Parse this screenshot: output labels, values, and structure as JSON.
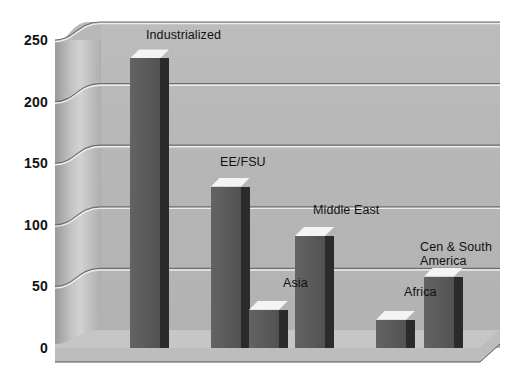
{
  "chart_data": {
    "type": "bar",
    "title": "",
    "subtitle": "",
    "xlabel": "",
    "ylabel": "",
    "categories": [
      "Industrialized",
      "EE/FSU",
      "Asia",
      "Middle East",
      "Africa",
      "Cen & South\nAmerica"
    ],
    "values": [
      235,
      131,
      31,
      91,
      23,
      58
    ],
    "ylim": [
      0,
      250
    ],
    "ytick_values": [
      0,
      50,
      100,
      150,
      200,
      250
    ],
    "ytick_labels": [
      "0",
      "50",
      "100",
      "150",
      "200",
      "250"
    ],
    "grid": true,
    "grid_axis": "y",
    "legend": "none",
    "style": "3d-bar",
    "series": [
      {
        "name": "",
        "values": [
          235,
          131,
          31,
          91,
          23,
          58
        ]
      }
    ],
    "point_labels": [
      {
        "category": "Industrialized",
        "label": "Industrialized"
      },
      {
        "category": "EE/FSU",
        "label": "EE/FSU"
      },
      {
        "category": "Asia",
        "label": "Asia"
      },
      {
        "category": "Middle East",
        "label": "Middle East"
      },
      {
        "category": "Africa",
        "label": "Africa"
      },
      {
        "category": "Cen & South America",
        "label": "Cen & South\nAmerica"
      }
    ]
  },
  "colors": {
    "background": "#ffffff",
    "back_wall": "#b8b8b8",
    "side_wall": "#c6c6c6",
    "floor": "#c2c2c2",
    "bar_face": "#5a5a5a",
    "bar_side": "#2b2b2b",
    "bar_top": "#f2f2f2",
    "gridline": "#7d7d7d",
    "text": "#111111"
  }
}
